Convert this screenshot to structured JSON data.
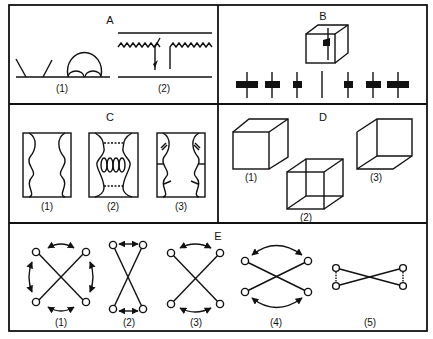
{
  "figure": {
    "panels": [
      {
        "id": "A",
        "title": "A",
        "items": [
          {
            "label": "(1)"
          },
          {
            "label": "(2)"
          }
        ]
      },
      {
        "id": "B",
        "title": "B",
        "items": []
      },
      {
        "id": "C",
        "title": "C",
        "items": [
          {
            "label": "(1)"
          },
          {
            "label": "(2)"
          },
          {
            "label": "(3)"
          }
        ]
      },
      {
        "id": "D",
        "title": "D",
        "items": [
          {
            "label": "(1)"
          },
          {
            "label": "(2)"
          },
          {
            "label": "(3)"
          }
        ]
      },
      {
        "id": "E",
        "title": "E",
        "items": [
          {
            "label": "(1)"
          },
          {
            "label": "(2)"
          },
          {
            "label": "(3)"
          },
          {
            "label": "(4)"
          },
          {
            "label": "(5)"
          }
        ]
      }
    ]
  },
  "colors": {
    "line": "#111111",
    "background": "#ffffff"
  }
}
